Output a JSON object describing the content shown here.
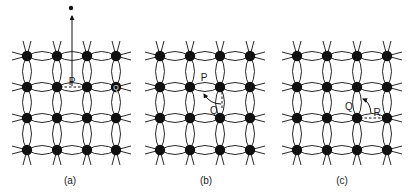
{
  "figure": {
    "panels": [
      {
        "id": "a",
        "caption": "(a)",
        "grid_x": [
          27,
          57,
          87,
          116
        ],
        "grid_y": [
          56,
          87,
          118,
          150
        ],
        "caption_pos": [
          70,
          184
        ],
        "labels": [
          {
            "text": "P",
            "x": 72,
            "y": 85
          },
          {
            "text": "Q",
            "x": 116,
            "y": 90,
            "inverted": true
          }
        ],
        "annotations": {
          "escaped_atom": {
            "x": 71,
            "y": 8
          },
          "arrow": {
            "from": [
              72,
              86
            ],
            "to": [
              72,
              16
            ]
          },
          "dashed": {
            "from": [
              60,
              87
            ],
            "to": [
              85,
              87
            ]
          }
        }
      },
      {
        "id": "b",
        "caption": "(b)",
        "grid_x": [
          160,
          190,
          220,
          250
        ],
        "grid_y": [
          56,
          87,
          118,
          150
        ],
        "caption_pos": [
          206,
          184
        ],
        "labels": [
          {
            "text": "P",
            "x": 204,
            "y": 81
          },
          {
            "text": "Q",
            "x": 214,
            "y": 114
          }
        ],
        "annotations": {
          "curved_arrow": {
            "path": "M221 104 Q 210 104 204 94"
          },
          "dashed": {
            "from": [
              222,
              92
            ],
            "to": [
              222,
              110
            ]
          }
        }
      },
      {
        "id": "c",
        "caption": "(c)",
        "grid_x": [
          297,
          327,
          357,
          387
        ],
        "grid_y": [
          56,
          87,
          118,
          150
        ],
        "caption_pos": [
          342,
          184
        ],
        "labels": [
          {
            "text": "Q",
            "x": 349,
            "y": 110
          },
          {
            "text": "R",
            "x": 377,
            "y": 116
          }
        ],
        "annotations": {
          "curved_arrow": {
            "path": "M371 113 Q 370 102 363 99"
          },
          "dashed": {
            "from": [
              360,
              118
            ],
            "to": [
              384,
              118
            ]
          }
        }
      }
    ],
    "colors": {
      "ink": "#111111",
      "paper": "#ffffff"
    }
  }
}
